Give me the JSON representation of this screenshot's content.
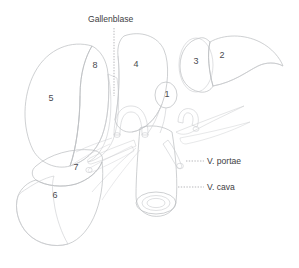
{
  "figure": {
    "background_color": "#ffffff",
    "width": 299,
    "height": 268
  },
  "annotations": [
    {
      "id": "gallenblase",
      "label": "Gallenblase",
      "x": 88,
      "y": 22,
      "leader": "dotted-vertical",
      "anchor_x": 114,
      "anchor_y": 96
    },
    {
      "id": "v-portae",
      "label": "V. portae",
      "x": 207,
      "y": 164,
      "leader": "dotted-horizontal",
      "anchor_x": 182,
      "anchor_y": 161
    },
    {
      "id": "v-cava",
      "label": "V. cava",
      "x": 207,
      "y": 190,
      "leader": "dotted-horizontal",
      "anchor_x": 170,
      "anchor_y": 187
    }
  ],
  "segments": [
    {
      "number": "1",
      "x": 167,
      "y": 95,
      "name": "segment-1"
    },
    {
      "number": "2",
      "x": 222,
      "y": 56,
      "name": "segment-2"
    },
    {
      "number": "3",
      "x": 196,
      "y": 62,
      "name": "segment-3"
    },
    {
      "number": "4",
      "x": 136,
      "y": 65,
      "name": "segment-4"
    },
    {
      "number": "5",
      "x": 51,
      "y": 99,
      "name": "segment-5"
    },
    {
      "number": "6",
      "x": 55,
      "y": 196,
      "name": "segment-6"
    },
    {
      "number": "7",
      "x": 76,
      "y": 168,
      "name": "segment-7"
    },
    {
      "number": "8",
      "x": 95,
      "y": 66,
      "name": "segment-8"
    }
  ],
  "colors": {
    "outline": "#b9bbbe",
    "fill_light": "#fcfcfd",
    "fill_mid": "#e8eaec",
    "fill_dark": "#d2d5d8",
    "vessel": "#c2c5c9",
    "text": "#3e3e43",
    "leader": "#9a9a9e"
  }
}
